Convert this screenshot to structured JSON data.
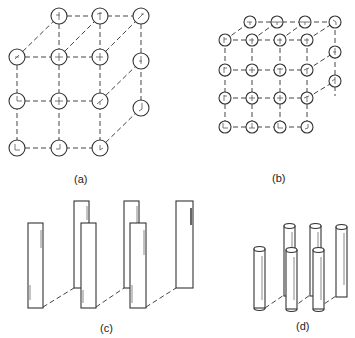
{
  "panels": [
    {
      "id": "a",
      "label": "(a)",
      "description": "3x3 front grid of circular sites with perspective depth showing cubic lattice"
    },
    {
      "id": "b",
      "label": "(b)",
      "description": "4x4 front grid of circular sites with perspective depth showing dense cubic lattice"
    },
    {
      "id": "c",
      "label": "(c)",
      "description": "Array of rectangular plates in two staggered rows"
    },
    {
      "id": "d",
      "label": "(d)",
      "description": "Array of vertical cylindrical rods in two staggered rows"
    }
  ],
  "colors": {
    "stroke": "#333333",
    "background": "#ffffff"
  }
}
